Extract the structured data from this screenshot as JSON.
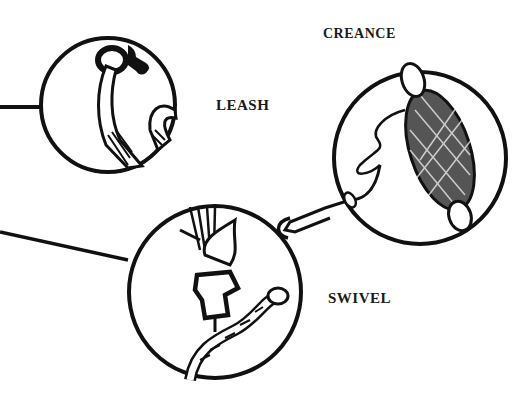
{
  "diagram": {
    "labels": {
      "leash": "LEASH",
      "creance": "CREANCE",
      "swivel": "SWIVEL"
    },
    "parts": [
      {
        "name": "leash",
        "icon": "leash-ring-and-strap-icon"
      },
      {
        "name": "creance",
        "icon": "creance-line-on-netted-spool-icon"
      },
      {
        "name": "swivel",
        "icon": "swivel-jesses-and-ring-icon"
      }
    ],
    "colors": {
      "ink": "#111111",
      "paper": "#ffffff"
    }
  }
}
